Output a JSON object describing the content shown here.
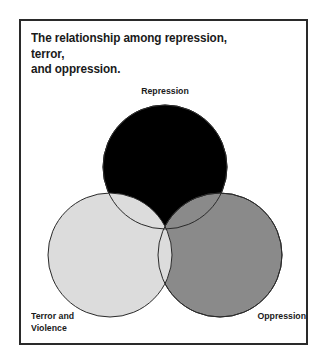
{
  "figure": {
    "title": "The relationship among repression, terror,\nand oppression.",
    "frame_color": "#2a2a2a",
    "background_color": "#ffffff"
  },
  "chart_data": {
    "type": "diagram",
    "diagram_type": "venn",
    "title": "The relationship among repression, terror, and oppression.",
    "set_count": 3,
    "sets": [
      {
        "id": "repression",
        "label": "Repression",
        "fill": "#000000",
        "stroke": "#2a2a2a",
        "center_x": 165,
        "center_y": 167,
        "radius": 62,
        "paint_order": 1,
        "label_position": "top-center"
      },
      {
        "id": "terror-and-violence",
        "label": "Terror and\nViolence",
        "fill": "#dcdcdc",
        "stroke": "#2a2a2a",
        "center_x": 110,
        "center_y": 255,
        "radius": 62,
        "paint_order": 3,
        "label_position": "bottom-left"
      },
      {
        "id": "oppression",
        "label": "Oppression",
        "fill": "#8a8a8a",
        "stroke": "#2a2a2a",
        "center_x": 220,
        "center_y": 255,
        "radius": 62,
        "paint_order": 2,
        "label_position": "bottom-right"
      }
    ],
    "overlaps": [
      {
        "sets": [
          "repression",
          "terror-and-violence"
        ],
        "rendered_fill": "#dcdcdc"
      },
      {
        "sets": [
          "repression",
          "oppression"
        ],
        "rendered_fill": "#8a8a8a"
      },
      {
        "sets": [
          "terror-and-violence",
          "oppression"
        ],
        "rendered_fill": "#dcdcdc"
      },
      {
        "sets": [
          "repression",
          "terror-and-violence",
          "oppression"
        ],
        "rendered_fill": "#dcdcdc"
      }
    ],
    "fill_mode": "opaque",
    "legend": "none",
    "grid": false
  }
}
